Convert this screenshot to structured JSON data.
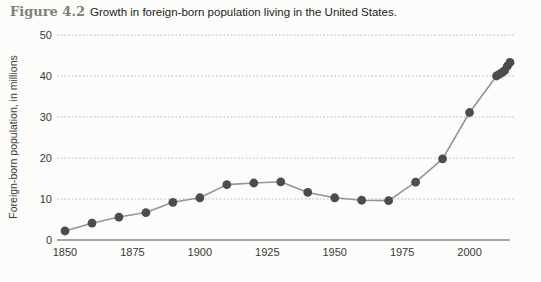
{
  "figure": {
    "label": "Figure 4.2",
    "caption": "Growth in foreign-born population living in the United States."
  },
  "chart_data": {
    "type": "line",
    "title": "Growth in foreign-born population living in the United States.",
    "series_name": "Foreign-born population",
    "x": [
      1850,
      1860,
      1870,
      1880,
      1890,
      1900,
      1910,
      1920,
      1930,
      1940,
      1950,
      1960,
      1970,
      1980,
      1990,
      2000,
      2010,
      2011,
      2012,
      2013,
      2014,
      2015
    ],
    "values": [
      2.2,
      4.1,
      5.6,
      6.7,
      9.2,
      10.3,
      13.5,
      13.9,
      14.2,
      11.6,
      10.3,
      9.7,
      9.6,
      14.1,
      19.8,
      31.1,
      40.0,
      40.4,
      40.8,
      41.3,
      42.4,
      43.3
    ],
    "xlabel": "",
    "ylabel": "Foreign-born population, in millions",
    "xticks": [
      1850,
      1875,
      1900,
      1925,
      1950,
      1975,
      2000
    ],
    "yticks": [
      0,
      10,
      20,
      30,
      40,
      50
    ],
    "xlim": [
      1847,
      2017
    ],
    "ylim": [
      0,
      50
    ],
    "grid": "horizontal-dotted",
    "legend": "none",
    "marker": "circle",
    "colors": {
      "line": "#949492",
      "marker": "#4c4c4a",
      "grid": "#b4b4b2",
      "axis": "#8a8a88",
      "tick_text": "#3a3a38"
    }
  }
}
